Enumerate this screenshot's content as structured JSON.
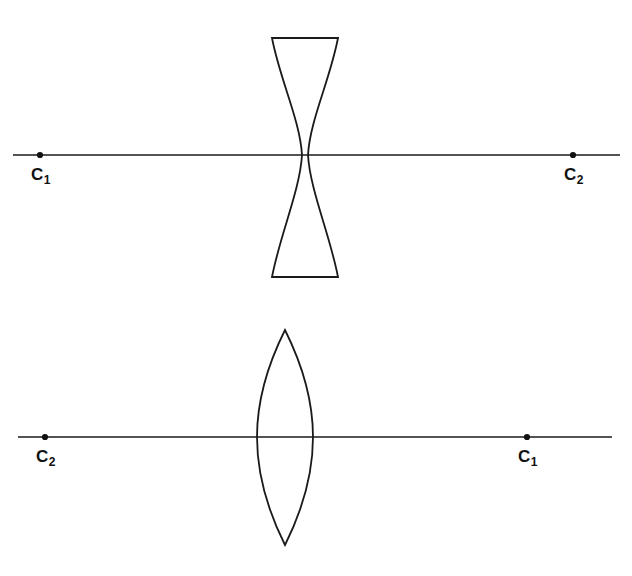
{
  "figure": {
    "width": 632,
    "height": 576,
    "background": "#ffffff",
    "stroke_color": "#1a1a1a",
    "label_color": "#111111"
  },
  "diagrams": [
    {
      "id": "upper-diagram",
      "lens_type": "biconcave",
      "description": "Biconcave (diverging) lens with horizontal optical axis",
      "axis": {
        "y": 155,
        "x_start": 13,
        "x_end": 620
      },
      "lens": {
        "center_x": 305,
        "top_y": 38,
        "bottom_y": 277,
        "edge_half_width": 33,
        "waist_half_width": 3
      },
      "points": [
        {
          "name": "C1",
          "base": "C",
          "subscript": "1",
          "x": 40,
          "y": 155,
          "label_x": 31,
          "label_y": 166
        },
        {
          "name": "C2",
          "base": "C",
          "subscript": "2",
          "x": 573,
          "y": 155,
          "label_x": 564,
          "label_y": 166
        }
      ]
    },
    {
      "id": "lower-diagram",
      "lens_type": "biconvex",
      "description": "Biconvex (converging) lens with horizontal optical axis",
      "axis": {
        "y": 437,
        "x_start": 18,
        "x_end": 612
      },
      "lens": {
        "center_x": 285,
        "top_y": 330,
        "bottom_y": 545,
        "half_width": 28
      },
      "points": [
        {
          "name": "C2",
          "base": "C",
          "subscript": "2",
          "x": 45,
          "y": 437,
          "label_x": 36,
          "label_y": 448
        },
        {
          "name": "C1",
          "base": "C",
          "subscript": "1",
          "x": 527,
          "y": 437,
          "label_x": 518,
          "label_y": 448
        }
      ]
    }
  ]
}
